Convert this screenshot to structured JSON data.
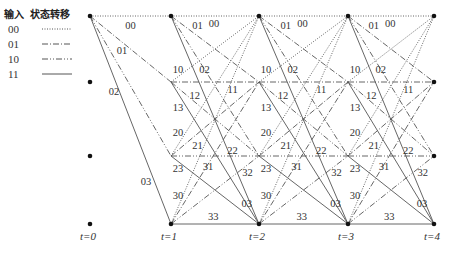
{
  "legend": {
    "header_input": "输入",
    "header_transition": "状态转移",
    "items": [
      {
        "input": "00",
        "style": "dotted"
      },
      {
        "input": "01",
        "style": "dash-dot"
      },
      {
        "input": "10",
        "style": "dash-dot-dot"
      },
      {
        "input": "11",
        "style": "solid"
      }
    ]
  },
  "time_labels": [
    "t=0",
    "t=1",
    "t=2",
    "t=3",
    "t=4"
  ],
  "trellis": {
    "states": [
      0,
      1,
      2,
      3
    ],
    "columns_x": [
      90,
      171,
      259,
      348,
      434
    ],
    "rows_y": [
      16,
      82,
      156,
      224
    ],
    "initial_transitions": [
      "00",
      "01",
      "02",
      "03"
    ],
    "full_transitions": [
      "00",
      "01",
      "02",
      "03",
      "10",
      "11",
      "12",
      "13",
      "20",
      "21",
      "22",
      "23",
      "30",
      "31",
      "32",
      "33"
    ],
    "line_color": "#555555"
  }
}
